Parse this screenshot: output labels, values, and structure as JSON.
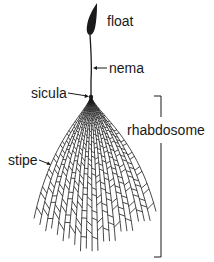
{
  "diagram": {
    "labels": {
      "float": "float",
      "nema": "nema",
      "sicula": "sicula",
      "rhabdosome": "rhabdosome",
      "stipe": "stipe"
    },
    "colors": {
      "ink": "#1a1a1a",
      "background": "#ffffff"
    }
  }
}
